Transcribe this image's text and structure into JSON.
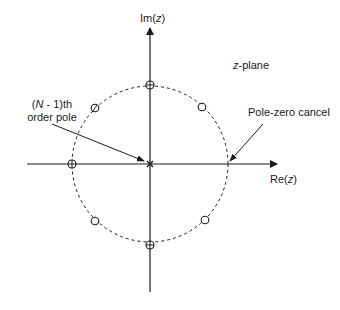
{
  "diagram": {
    "title": "z-plane",
    "plane_label": {
      "italic": "z",
      "rest": "-plane"
    },
    "axes": {
      "imag": {
        "prefix": "Im(",
        "var": "z",
        "suffix": ")"
      },
      "real": {
        "prefix": "Re(",
        "var": "z",
        "suffix": ")"
      }
    },
    "annotations": {
      "pole": {
        "line1_open": "(",
        "line1_var": "N",
        "line1_rest": " - 1)th",
        "line2": "order pole"
      },
      "cancel": {
        "text": "Pole-zero cancel"
      }
    },
    "unit_circle": {
      "style": "dashed",
      "center": [
        150,
        164
      ],
      "radius_px": 78
    },
    "markers": [
      {
        "type": "pole-zero-crosshair",
        "angle_deg": 90
      },
      {
        "type": "zero",
        "angle_deg": 135
      },
      {
        "type": "zero",
        "angle_deg": 45
      },
      {
        "type": "pole-zero-crosshair",
        "angle_deg": 180
      },
      {
        "type": "multiple-pole",
        "position": "origin"
      },
      {
        "type": "pole-zero-cancel",
        "angle_deg": 0
      },
      {
        "type": "zero",
        "angle_deg": 225
      },
      {
        "type": "zero",
        "angle_deg": 315
      },
      {
        "type": "pole-zero-crosshair",
        "angle_deg": 270
      }
    ],
    "colors": {
      "ink": "#1a1a1a",
      "background": "#ffffff"
    }
  }
}
